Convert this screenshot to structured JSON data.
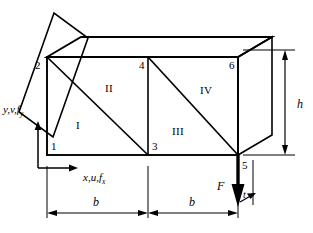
{
  "figure": {
    "name": "finite-element-mesh-cantilever-plate"
  },
  "nodes": [
    {
      "id": "node-1",
      "label": "1",
      "x": 47,
      "y": 155
    },
    {
      "id": "node-2",
      "label": "2",
      "x": 47,
      "y": 57
    },
    {
      "id": "node-3",
      "label": "3",
      "x": 148,
      "y": 155
    },
    {
      "id": "node-4",
      "label": "4",
      "x": 148,
      "y": 57
    },
    {
      "id": "node-5",
      "label": "5",
      "x": 238,
      "y": 155
    },
    {
      "id": "node-6",
      "label": "6",
      "x": 238,
      "y": 57
    }
  ],
  "elements": [
    {
      "id": "element-1",
      "label": "I"
    },
    {
      "id": "element-2",
      "label": "II"
    },
    {
      "id": "element-3",
      "label": "III"
    },
    {
      "id": "element-4",
      "label": "IV"
    }
  ],
  "axes": {
    "y_axis": {
      "label": "y,v,",
      "symbol": "f",
      "subscript": "y"
    },
    "x_axis": {
      "label": "x,u,",
      "symbol": "f",
      "subscript": "x"
    }
  },
  "dimensions": [
    {
      "id": "dim-b-left",
      "label": "b"
    },
    {
      "id": "dim-b-right",
      "label": "b"
    },
    {
      "id": "dim-h",
      "label": "h"
    },
    {
      "id": "dim-t",
      "label": "t"
    }
  ],
  "load": {
    "label": "F"
  },
  "colors": {
    "ink": "#000000",
    "background": "#ffffff"
  }
}
